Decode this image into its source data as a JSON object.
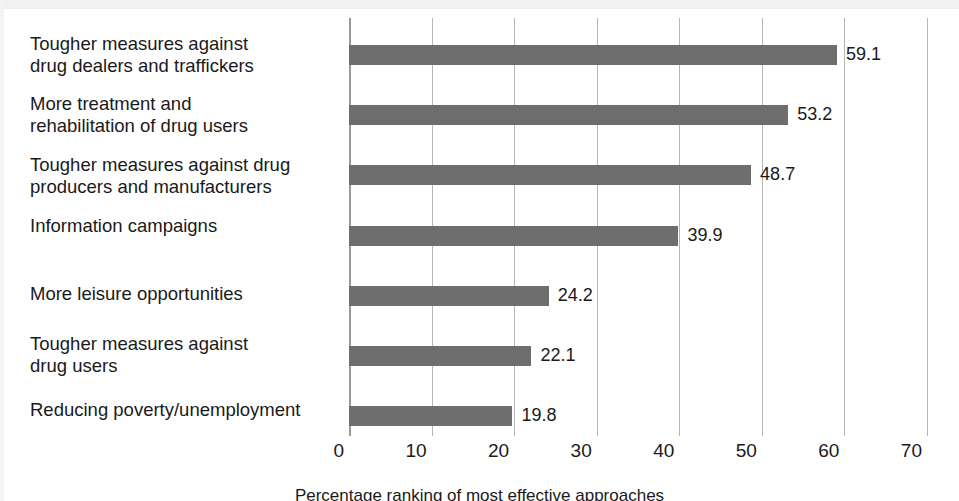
{
  "chart_data": {
    "type": "bar",
    "orientation": "horizontal",
    "title": "",
    "subtitle": "",
    "xlabel": "Percentage ranking of most effective approaches",
    "ylabel": "",
    "xlim": [
      0,
      70
    ],
    "xticks": [
      0,
      10,
      20,
      30,
      40,
      50,
      60,
      70
    ],
    "xtick_labels": [
      "0",
      "10",
      "20",
      "30",
      "40",
      "50",
      "60",
      "70"
    ],
    "grid": "vertical",
    "legend": "none",
    "bar_color": "#6e6e6e",
    "categories": [
      "Tougher measures against\ndrug dealers and traffickers",
      "More treatment and\nrehabilitation of drug users",
      "Tougher measures against drug\nproducers and manufacturers",
      "Information campaigns",
      "More leisure opportunities",
      "Tougher measures against\ndrug users",
      "Reducing poverty/unemployment"
    ],
    "values": [
      59.1,
      53.2,
      48.7,
      39.9,
      24.2,
      22.1,
      19.8
    ],
    "value_labels": [
      "59.1",
      "53.2",
      "48.7",
      "39.9",
      "24.2",
      "22.1",
      "19.8"
    ]
  },
  "caption": "Percentage ranking of most effective approaches"
}
